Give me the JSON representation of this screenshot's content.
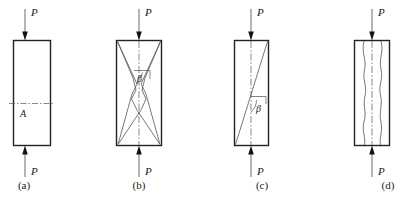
{
  "figure": {
    "background_color": "#ffffff",
    "outline_color": "#222222",
    "crack_color": "#555555",
    "panels": [
      {
        "id": "a",
        "caption": "(a)",
        "top_load_label": "P",
        "bottom_load_label": "P",
        "area_label": "A",
        "feature": "transverse-section-line"
      },
      {
        "id": "b",
        "caption": "(b)",
        "top_load_label": "P",
        "bottom_load_label": "P",
        "angle_label": "β",
        "feature": "double-cone-shear-cracks"
      },
      {
        "id": "c",
        "caption": "(c)",
        "top_load_label": "P",
        "bottom_load_label": "P",
        "angle_label": "β",
        "feature": "single-diagonal-shear-crack"
      },
      {
        "id": "d",
        "caption": "(d)",
        "top_load_label": "P",
        "bottom_load_label": "P",
        "feature": "longitudinal-splitting-cracks"
      }
    ]
  }
}
